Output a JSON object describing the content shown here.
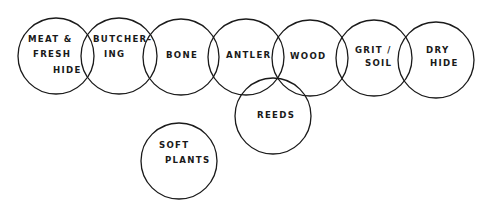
{
  "diagram": {
    "circles": [
      {
        "id": "meat-fresh-hide",
        "cx": 56,
        "cy": 56,
        "r": 38,
        "lines": [
          {
            "text": "MEAT &",
            "x": 28,
            "y": 42
          },
          {
            "text": "FRESH",
            "x": 33,
            "y": 57
          },
          {
            "text": "HIDE",
            "x": 53,
            "y": 73
          }
        ]
      },
      {
        "id": "butchering",
        "cx": 119,
        "cy": 56,
        "r": 38,
        "lines": [
          {
            "text": "BUTCHER-",
            "x": 93,
            "y": 42
          },
          {
            "text": "ING",
            "x": 104,
            "y": 57
          }
        ]
      },
      {
        "id": "bone",
        "cx": 181,
        "cy": 57,
        "r": 38,
        "lines": [
          {
            "text": "BONE",
            "x": 166,
            "y": 58
          }
        ]
      },
      {
        "id": "antler",
        "cx": 246,
        "cy": 57,
        "r": 38,
        "lines": [
          {
            "text": "ANTLER",
            "x": 226,
            "y": 58
          }
        ]
      },
      {
        "id": "wood",
        "cx": 310,
        "cy": 58,
        "r": 38,
        "lines": [
          {
            "text": "WOOD",
            "x": 290,
            "y": 59
          }
        ]
      },
      {
        "id": "grit-soil",
        "cx": 374,
        "cy": 58,
        "r": 38,
        "lines": [
          {
            "text": "GRIT /",
            "x": 355,
            "y": 53
          },
          {
            "text": "SOIL",
            "x": 365,
            "y": 66
          }
        ]
      },
      {
        "id": "dry-hide",
        "cx": 436,
        "cy": 60,
        "r": 38,
        "lines": [
          {
            "text": "DRY",
            "x": 426,
            "y": 53
          },
          {
            "text": "HIDE",
            "x": 430,
            "y": 66
          }
        ]
      },
      {
        "id": "reeds",
        "cx": 273,
        "cy": 116,
        "r": 38,
        "lines": [
          {
            "text": "REEDS",
            "x": 257,
            "y": 118
          }
        ]
      },
      {
        "id": "soft-plants",
        "cx": 179,
        "cy": 161,
        "r": 38,
        "lines": [
          {
            "text": "SOFT",
            "x": 159,
            "y": 148
          },
          {
            "text": "PLANTS",
            "x": 165,
            "y": 163
          }
        ]
      }
    ]
  }
}
